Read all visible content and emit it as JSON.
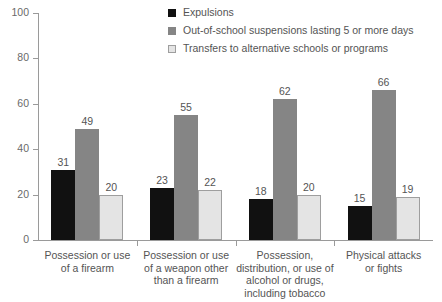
{
  "chart_data": {
    "type": "bar",
    "title": "",
    "subtitle": "",
    "xlabel": "",
    "ylabel": "",
    "ylim": [
      0,
      100
    ],
    "yticks": [
      0,
      20,
      40,
      60,
      80,
      100
    ],
    "grid": false,
    "legend_position": "top-right",
    "categories": [
      "Possession or use of a firearm",
      "Possession or use of a weapon other than a firearm",
      "Possession, distribution, or use of alcohol or drugs, including tobacco",
      "Physical attacks or fights"
    ],
    "category_lines": [
      [
        "Possession or use",
        "of a firearm"
      ],
      [
        "Possession or use",
        "of a weapon other",
        "than a firearm"
      ],
      [
        "Possession,",
        "distribution, or use of",
        "alcohol or drugs,",
        "including tobacco"
      ],
      [
        "Physical attacks",
        "or fights"
      ]
    ],
    "series": [
      {
        "name": "Expulsions",
        "color": "#111111",
        "values": [
          31,
          23,
          18,
          15
        ]
      },
      {
        "name": "Out-of-school suspensions lasting 5 or more days",
        "color": "#858585",
        "values": [
          49,
          55,
          62,
          66
        ]
      },
      {
        "name": "Transfers to alternative schools or programs",
        "color": "#e4e4e4",
        "values": [
          20,
          22,
          20,
          19
        ]
      }
    ]
  }
}
